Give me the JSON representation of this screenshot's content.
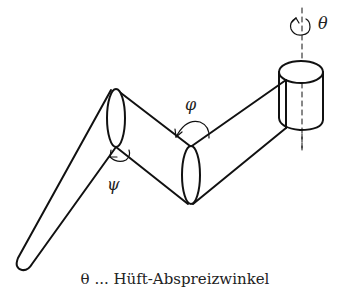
{
  "diagram": {
    "labels": {
      "theta": "θ",
      "phi": "φ",
      "psi": "ψ"
    },
    "caption": "θ ... Hüft-Abspreizwinkel",
    "components": [
      {
        "name": "hip-cylinder",
        "description": "Cylinder representing hip joint with vertical dashed rotation axis"
      },
      {
        "name": "thigh-link",
        "description": "Upper segment from hip to knee"
      },
      {
        "name": "knee-joint",
        "description": "Elliptical joint between thigh and shank"
      },
      {
        "name": "shank-link",
        "description": "Middle segment"
      },
      {
        "name": "ankle-joint",
        "description": "Elliptical joint"
      },
      {
        "name": "foot-link",
        "description": "Tapered lower segment"
      }
    ],
    "stroke_color": "#111111",
    "background": "#ffffff"
  }
}
